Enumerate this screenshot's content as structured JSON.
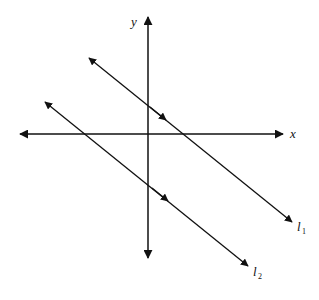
{
  "diagram": {
    "axes": {
      "x_label": "x",
      "y_label": "y"
    },
    "lines": [
      {
        "name": "l1",
        "label_main": "l",
        "label_sub": "1",
        "relation": "parallel"
      },
      {
        "name": "l2",
        "label_main": "l",
        "label_sub": "2",
        "relation": "parallel"
      }
    ],
    "stroke_color": "#111111"
  }
}
